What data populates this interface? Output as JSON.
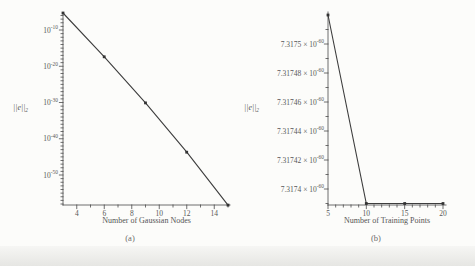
{
  "figure": {
    "caption_a": "(a)",
    "caption_b": "(b)",
    "norm_label": "||e||",
    "norm_sub": "2"
  },
  "chart_data": [
    {
      "type": "line",
      "subfigure": "(a)",
      "title": "",
      "xlabel": "Number of Gaussian Nodes",
      "ylabel": "||e||_2",
      "yscale": "log",
      "grid": false,
      "legend": "none",
      "xlim": [
        3,
        15
      ],
      "ylim": [
        5e-59,
        5e-06
      ],
      "x": [
        3,
        6,
        9,
        12,
        15
      ],
      "values": [
        5e-06,
        4e-18,
        8e-31,
        2e-44,
        5e-59
      ],
      "xticks": {
        "major": [
          4,
          6,
          8,
          10,
          12,
          14
        ],
        "minor": [
          5,
          7,
          9,
          11,
          13,
          15
        ],
        "major_labels": [
          "4",
          "6",
          "8",
          "10",
          "12",
          "14"
        ]
      },
      "yticks": {
        "base": "10",
        "major_exponents": [
          -10,
          -20,
          -30,
          -40,
          -50
        ],
        "major_labels": [
          "10^-10",
          "10^-20",
          "10^-30",
          "10^-40",
          "10^-50"
        ]
      }
    },
    {
      "type": "line",
      "subfigure": "(b)",
      "title": "",
      "xlabel": "Number of Training Points",
      "ylabel": "||e||_2",
      "yscale": "linear",
      "grid": false,
      "legend": "none",
      "xlim": [
        5,
        20
      ],
      "ylim": [
        7.31739e-60,
        7.31752e-60
      ],
      "x": [
        5,
        10,
        15,
        20
      ],
      "values": [
        7.31752e-60,
        7.31739e-60,
        7.31739e-60,
        7.31739e-60
      ],
      "xticks": {
        "major": [
          5,
          10,
          15,
          20
        ],
        "minor": [
          6,
          7,
          8,
          9,
          11,
          12,
          13,
          14,
          16,
          17,
          18,
          19
        ],
        "major_labels": [
          "5",
          "10",
          "15",
          "20"
        ]
      },
      "yticks": {
        "exponent": "-60",
        "major_mantissas": [
          "7.3175",
          "7.31748",
          "7.31746",
          "7.31744",
          "7.31742",
          "7.3174"
        ],
        "major_labels": [
          "7.3175 x 10^-60",
          "7.31748 x 10^-60",
          "7.31746 x 10^-60",
          "7.31744 x 10^-60",
          "7.31742 x 10^-60",
          "7.3174 x 10^-60"
        ]
      }
    }
  ]
}
